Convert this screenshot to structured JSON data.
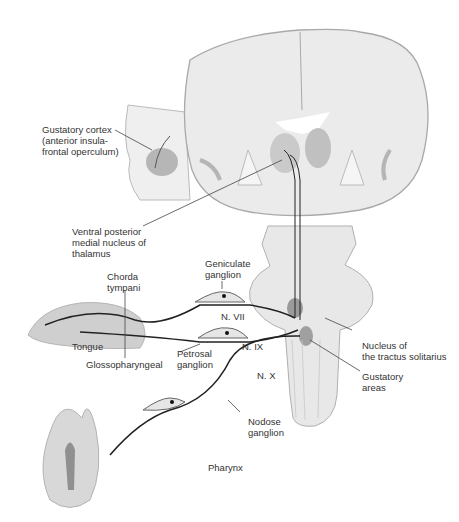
{
  "diagram": {
    "labels": {
      "gustatory_cortex": "Gustatory cortex\n(anterior insula-\nfrontal operculum)",
      "vpm": "Ventral posterior\nmedial nucleus of\nthalamus",
      "chorda_tympani": "Chorda\ntympani",
      "geniculate_ganglion": "Geniculate\nganglion",
      "n_vii": "N. VII",
      "n_ix": "N. IX",
      "n_x": "N. X",
      "tongue": "Tongue",
      "glossopharyngeal": "Glossopharyngeal",
      "petrosal_ganglion": "Petrosal\nganglion",
      "nucleus_tractus_solitarius": "Nucleus of\nthe tractus solitarius",
      "gustatory_areas": "Gustatory\nareas",
      "nodose_ganglion": "Nodose\nganglion",
      "pharynx": "Pharynx"
    },
    "colors": {
      "tissue": "#e8e8e8",
      "tissue_outline": "#a9a9a9",
      "highlight": "#9a9a9a",
      "nerve": "#222222",
      "text": "#333333"
    }
  }
}
